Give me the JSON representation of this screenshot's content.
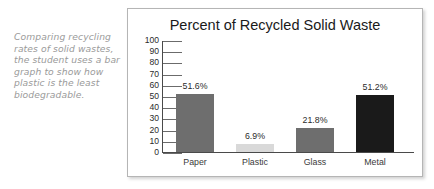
{
  "caption": {
    "text": "Comparing recycling rates of solid wastes, the student uses a bar graph to show how plastic is the least biodegradable."
  },
  "chart_data": {
    "type": "bar",
    "title": "Percent of Recycled Solid Waste",
    "xlabel": "",
    "ylabel": "",
    "ylim": [
      0,
      100
    ],
    "yticks": [
      "0",
      "10",
      "20",
      "30",
      "40",
      "50",
      "60",
      "70",
      "80",
      "90",
      "100"
    ],
    "grid": false,
    "legend": "none",
    "categories": [
      "Paper",
      "Plastic",
      "Glass",
      "Metal"
    ],
    "values": [
      51.6,
      6.9,
      21.8,
      51.2
    ],
    "value_labels": [
      "51.6%",
      "6.9%",
      "21.8%",
      "51.2%"
    ],
    "bar_colors": [
      "#6e6e6e",
      "#d9d9d9",
      "#6e6e6e",
      "#1a1a1a"
    ],
    "axis_color": "#4a4a4a"
  }
}
